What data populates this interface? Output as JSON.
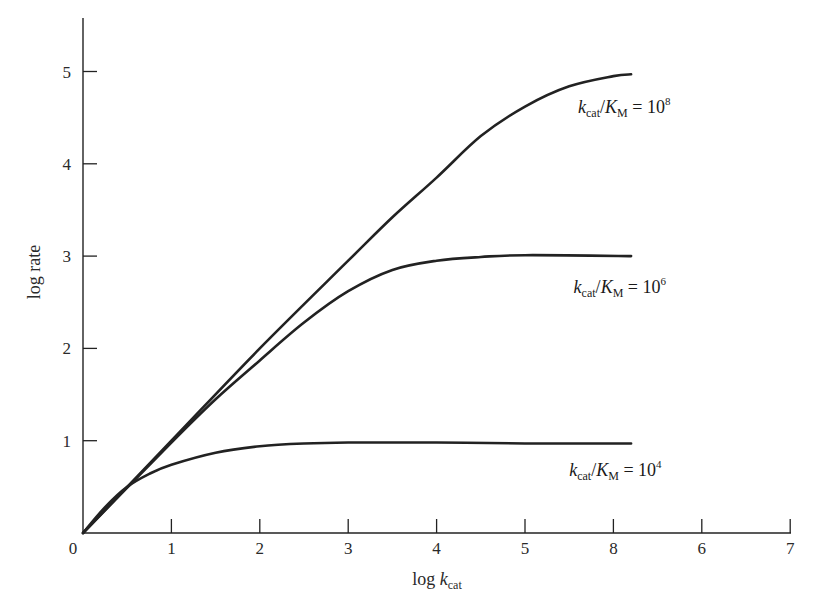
{
  "chart_data": {
    "type": "line",
    "title": "",
    "xlabel": "log k_cat",
    "xlabel_parts": {
      "main": "log ",
      "italic": "k",
      "sub": "cat"
    },
    "ylabel": "log rate",
    "xlim": [
      0,
      7
    ],
    "ylim": [
      0,
      5.6
    ],
    "grid": false,
    "legend": "inline labels beside each curve",
    "x_tick_positions": [
      0,
      1,
      2,
      3,
      4,
      5,
      6,
      7,
      8
    ],
    "x_tick_labels": [
      "0",
      "1",
      "2",
      "3",
      "4",
      "5",
      "8",
      "6",
      "7"
    ],
    "y_ticks": [
      1,
      2,
      3,
      4,
      5
    ],
    "y_tick_labels": [
      "1",
      "2",
      "3",
      "4",
      "5"
    ],
    "origin_label": "0",
    "series": [
      {
        "name": "k_cat/K_M = 10^8",
        "label": {
          "k": "k",
          "ksub": "cat",
          "slash": "/",
          "K": "K",
          "Ksub": "M",
          "eq": " = 10",
          "exp": "8"
        },
        "label_pos": [
          5.6,
          4.55
        ],
        "x": [
          0,
          1,
          2,
          3,
          3.5,
          4,
          4.5,
          5,
          5.5,
          6,
          6.2
        ],
        "y": [
          0,
          1.0,
          2.0,
          2.95,
          3.42,
          3.85,
          4.3,
          4.62,
          4.84,
          4.95,
          4.97
        ]
      },
      {
        "name": "k_cat/K_M = 10^6",
        "label": {
          "k": "k",
          "ksub": "cat",
          "slash": "/",
          "K": "K",
          "Ksub": "M",
          "eq": " = 10",
          "exp": "6"
        },
        "label_pos": [
          5.55,
          2.6
        ],
        "x": [
          0,
          1,
          1.5,
          2,
          2.5,
          3,
          3.5,
          4,
          4.5,
          5,
          6.2
        ],
        "y": [
          0,
          0.98,
          1.45,
          1.87,
          2.28,
          2.62,
          2.85,
          2.95,
          2.99,
          3.01,
          3.0
        ]
      },
      {
        "name": "k_cat/K_M = 10^4",
        "label": {
          "k": "k",
          "ksub": "cat",
          "slash": "/",
          "K": "K",
          "Ksub": "M",
          "eq": " = 10",
          "exp": "4"
        },
        "label_pos": [
          5.5,
          0.62
        ],
        "x": [
          0,
          0.25,
          0.5,
          0.75,
          1,
          1.5,
          2,
          2.5,
          3,
          4,
          5,
          6.2
        ],
        "y": [
          0,
          0.28,
          0.5,
          0.64,
          0.74,
          0.87,
          0.94,
          0.97,
          0.98,
          0.98,
          0.97,
          0.97
        ]
      }
    ]
  },
  "layout": {
    "origin_px": [
      83,
      533
    ],
    "x_unit_px": 88.4,
    "y_unit_px": 92.3,
    "x_axis_end_px": 791,
    "y_axis_top_px": 18,
    "line_color": "#222222",
    "curve_width": 2.6
  }
}
